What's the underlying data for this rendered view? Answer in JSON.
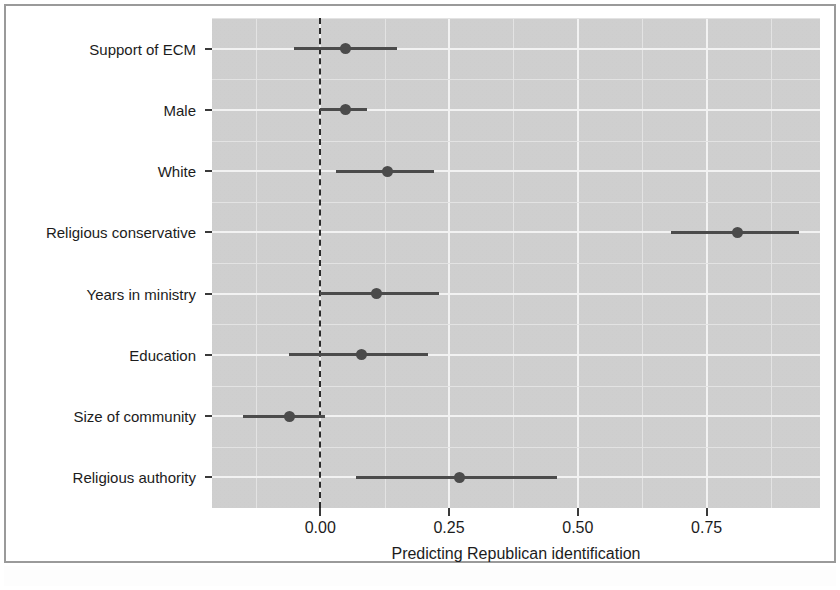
{
  "figure": {
    "x_axis_title": "Predicting Republican identification",
    "x_tick_labels": [
      "0.00",
      "0.25",
      "0.50",
      "0.75"
    ],
    "x_tick_values": [
      0.0,
      0.25,
      0.5,
      0.75
    ],
    "reference_line_value": "0.00",
    "panel_background_color": "#d2d2d2",
    "gridline_color": "#f2f2f2",
    "marker_color": "#4b4b4b",
    "reference_line_color": "#2b2b2b"
  },
  "chart_data": {
    "type": "scatter",
    "subtype": "coefficient-plot-with-error-bars",
    "title": "",
    "xlabel": "Predicting Republican identification",
    "ylabel": "",
    "xlim": [
      -0.21,
      0.97
    ],
    "xticks": [
      0.0,
      0.25,
      0.5,
      0.75
    ],
    "xticklabels": [
      "0.00",
      "0.25",
      "0.50",
      "0.75"
    ],
    "grid": true,
    "legend": null,
    "reference_line": 0.0,
    "reference_line_style": "dashed",
    "categories": [
      "Support of ECM",
      "Male",
      "White",
      "Religious conservative",
      "Years in ministry",
      "Education",
      "Size of community",
      "Religious authority"
    ],
    "estimates": [
      0.05,
      0.05,
      0.13,
      0.81,
      0.11,
      0.08,
      -0.06,
      0.27
    ],
    "ci_low": [
      -0.05,
      0.0,
      0.03,
      0.68,
      0.0,
      -0.06,
      -0.15,
      0.07
    ],
    "ci_high": [
      0.15,
      0.09,
      0.22,
      0.93,
      0.23,
      0.21,
      0.01,
      0.46
    ],
    "points": [
      {
        "label": "Support of ECM",
        "estimate": 0.05,
        "ci_low": -0.05,
        "ci_high": 0.15
      },
      {
        "label": "Male",
        "estimate": 0.05,
        "ci_low": 0.0,
        "ci_high": 0.09
      },
      {
        "label": "White",
        "estimate": 0.13,
        "ci_low": 0.03,
        "ci_high": 0.22
      },
      {
        "label": "Religious conservative",
        "estimate": 0.81,
        "ci_low": 0.68,
        "ci_high": 0.93
      },
      {
        "label": "Years in ministry",
        "estimate": 0.11,
        "ci_low": 0.0,
        "ci_high": 0.23
      },
      {
        "label": "Education",
        "estimate": 0.08,
        "ci_low": -0.06,
        "ci_high": 0.21
      },
      {
        "label": "Size of community",
        "estimate": -0.06,
        "ci_low": -0.15,
        "ci_high": 0.01
      },
      {
        "label": "Religious authority",
        "estimate": 0.27,
        "ci_low": 0.07,
        "ci_high": 0.46
      }
    ]
  }
}
